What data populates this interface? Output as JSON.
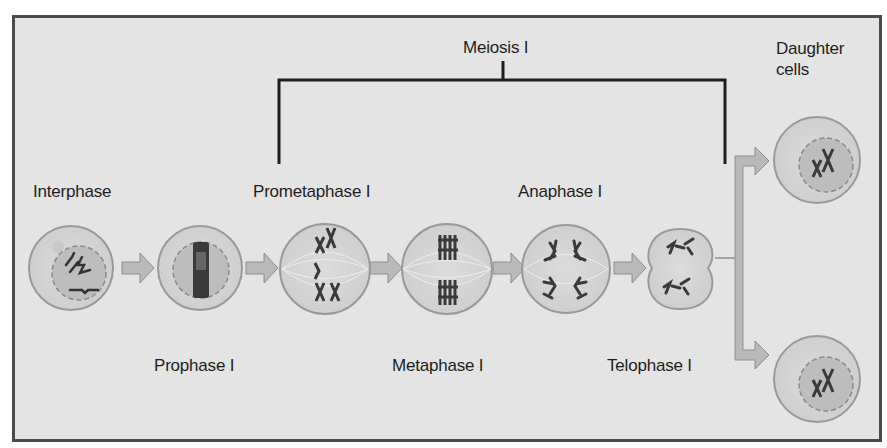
{
  "figure": {
    "title": "Meiosis I",
    "stages": [
      {
        "id": "interphase",
        "label": "Interphase"
      },
      {
        "id": "prophase",
        "label": "Prophase I"
      },
      {
        "id": "prometaphase",
        "label": "Prometaphase I"
      },
      {
        "id": "metaphase",
        "label": "Metaphase I"
      },
      {
        "id": "anaphase",
        "label": "Anaphase I"
      },
      {
        "id": "telophase",
        "label": "Telophase I"
      }
    ],
    "result": {
      "line1": "Daughter",
      "line2": "cells"
    },
    "colors": {
      "background": "#e4e4e4",
      "frame": "#4a4a4a",
      "cell_outline": "#9a9a9a",
      "cell_fill": "#d8d8d8",
      "nucleus_fill": "#bdbdbd",
      "chromosome": "#3a3a3a",
      "arrow": "#b9b9b9",
      "bracket": "#1e1e1e"
    }
  }
}
